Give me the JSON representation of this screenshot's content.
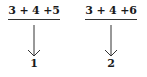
{
  "items": [
    {
      "expression": "3 + 4 +5",
      "result": "1"
    },
    {
      "expression": "3 + 4 +6",
      "result": "2"
    }
  ],
  "colors": {
    "ink": "#1a1a1a",
    "background": "#ffffff"
  }
}
